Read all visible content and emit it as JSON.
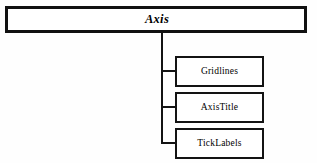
{
  "diagram": {
    "type": "class-hierarchy-tree",
    "background_color": "#fefefe",
    "line_color": "#131313",
    "root": {
      "label": "Axis",
      "style": "bold-italic"
    },
    "children": [
      {
        "id": "gridlines",
        "label": "Gridlines"
      },
      {
        "id": "axistitle",
        "label": "AxisTitle"
      },
      {
        "id": "ticklabels",
        "label": "TickLabels"
      }
    ]
  }
}
